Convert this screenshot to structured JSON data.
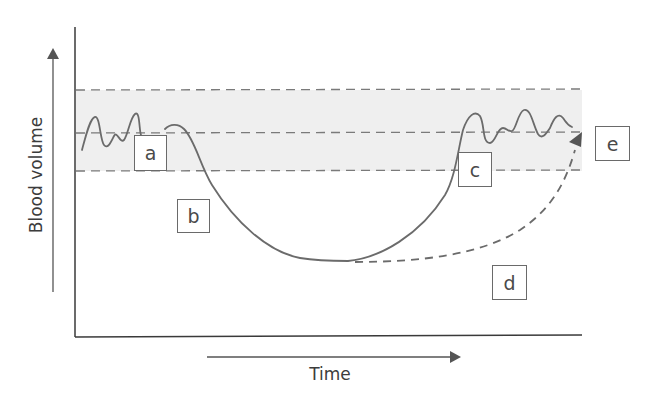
{
  "figure": {
    "y_axis_label": "Blood volume",
    "x_axis_label": "Time",
    "colors": {
      "line": "#6b6b6b",
      "axis": "#3a3a3a",
      "band_fill": "#efefef",
      "dash": "#7a7a7a",
      "box_border": "#6a6a6a",
      "text": "#4a4a4a"
    }
  },
  "labels": [
    {
      "id": "a",
      "text": "a"
    },
    {
      "id": "b",
      "text": "b"
    },
    {
      "id": "c",
      "text": "c"
    },
    {
      "id": "d",
      "text": "d"
    },
    {
      "id": "e",
      "text": "e"
    }
  ],
  "elements": {
    "normal_range_band": "shaded band with upper, middle and lower dashed reference lines",
    "solid_curve": "fluctuating baseline, drop to minimum, recovery back to band with fluctuations",
    "dashed_curve": "slower recovery path from minimum ending with arrowhead at band"
  }
}
